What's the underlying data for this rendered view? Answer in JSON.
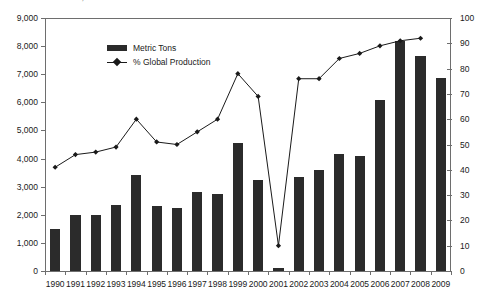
{
  "chart_title": "% Global Production, 1990-2009",
  "legend": {
    "position": "top-left-inside",
    "items": [
      {
        "label": "Metric Tons",
        "marker": "bar-swatch",
        "color": "#2b2b2b"
      },
      {
        "label": "% Global Production",
        "marker": "line-with-diamond",
        "color": "#1a1a1a"
      }
    ]
  },
  "axes": {
    "left": {
      "label": "",
      "min": 0,
      "max": 9000,
      "step": 1000,
      "ticks": [
        "0",
        "1,000",
        "2,000",
        "3,000",
        "4,000",
        "5,000",
        "6,000",
        "7,000",
        "8,000",
        "9,000"
      ]
    },
    "right": {
      "label": "",
      "min": 0,
      "max": 100,
      "step": 10,
      "ticks": [
        "0",
        "10",
        "20",
        "30",
        "40",
        "50",
        "60",
        "70",
        "80",
        "90",
        "100"
      ]
    },
    "bottom": {
      "label": "",
      "ticks": [
        "1990",
        "1991",
        "1992",
        "1993",
        "1994",
        "1995",
        "1996",
        "1997",
        "1998",
        "1999",
        "2000",
        "2001",
        "2002",
        "2003",
        "2004",
        "2005",
        "2006",
        "2007",
        "2008",
        "2009"
      ]
    }
  },
  "chart_data": {
    "type": "bar",
    "title": "% Global Production, 1990-2009",
    "xlabel": "",
    "ylabel": "Metric Tons",
    "ylim": [
      0,
      9000
    ],
    "y2label": "% Global Production",
    "y2lim": [
      0,
      100
    ],
    "grid": false,
    "legend_position": "top-left",
    "categories": [
      "1990",
      "1991",
      "1992",
      "1993",
      "1994",
      "1995",
      "1996",
      "1997",
      "1998",
      "1999",
      "2000",
      "2001",
      "2002",
      "2003",
      "2004",
      "2005",
      "2006",
      "2007",
      "2008",
      "2009"
    ],
    "series": [
      {
        "name": "Metric Tons",
        "type": "bar",
        "axis": "left",
        "color": "#2b2b2b",
        "values": [
          1500,
          2000,
          1980,
          2350,
          3400,
          2320,
          2250,
          2820,
          2750,
          4550,
          3250,
          100,
          3350,
          3580,
          4180,
          4080,
          6080,
          8200,
          7650,
          6850
        ]
      },
      {
        "name": "% Global Production",
        "type": "line",
        "axis": "right",
        "color": "#1a1a1a",
        "marker": "diamond",
        "values": [
          41,
          46,
          47,
          49,
          60,
          51,
          50,
          55,
          60,
          78,
          69,
          10,
          76,
          76,
          84,
          86,
          89,
          91,
          92,
          null
        ]
      }
    ]
  }
}
